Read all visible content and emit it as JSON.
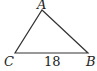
{
  "diagram": {
    "type": "triangle",
    "vertices": [
      {
        "label": "A",
        "x": 42,
        "y": 10
      },
      {
        "label": "B",
        "x": 88,
        "y": 53
      },
      {
        "label": "C",
        "x": 15,
        "y": 53
      }
    ],
    "side_labels": [
      {
        "side": "CB",
        "value": "18"
      }
    ],
    "stroke_color": "#333333"
  }
}
